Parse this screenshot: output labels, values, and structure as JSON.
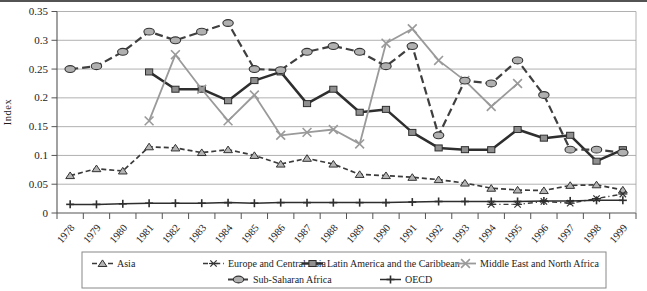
{
  "chart_data": {
    "type": "line",
    "title": "",
    "xlabel": "",
    "ylabel": "Index",
    "x": [
      1978,
      1979,
      1980,
      1981,
      1982,
      1983,
      1984,
      1985,
      1986,
      1987,
      1988,
      1989,
      1990,
      1991,
      1992,
      1993,
      1994,
      1995,
      1996,
      1997,
      1998,
      1999
    ],
    "ylim": [
      0,
      0.35
    ],
    "ytick_step": 0.05,
    "ytick_labels": [
      "0",
      "0.05",
      "0.1",
      "0.15",
      "0.2",
      "0.25",
      "0.3",
      "0.35"
    ],
    "grid": "horizontal",
    "legend_position": "bottom-box",
    "series": [
      {
        "name": "Asia",
        "marker": "triangle",
        "line": "dashed",
        "color": "#3a3a3a",
        "marker_fill": "#b4b4b4",
        "values": [
          0.065,
          0.077,
          0.073,
          0.115,
          0.113,
          0.105,
          0.11,
          0.1,
          0.085,
          0.095,
          0.085,
          0.067,
          0.065,
          0.062,
          0.058,
          0.052,
          0.043,
          0.04,
          0.039,
          0.048,
          0.049,
          0.04
        ]
      },
      {
        "name": "Europe and Central Asia",
        "marker": "asterisk",
        "line": "dash-dot",
        "color": "#3a3a3a",
        "marker_fill": "#3a3a3a",
        "values": [
          null,
          null,
          null,
          null,
          null,
          null,
          null,
          null,
          null,
          null,
          null,
          null,
          null,
          null,
          null,
          null,
          0.015,
          0.015,
          0.02,
          0.017,
          0.025,
          0.033
        ]
      },
      {
        "name": "Latin America and the Caribbean",
        "marker": "square",
        "line": "solid-thick",
        "color": "#2e2e2e",
        "marker_fill": "#8f8f8f",
        "values": [
          null,
          null,
          null,
          0.245,
          0.215,
          0.215,
          0.195,
          0.23,
          0.245,
          0.19,
          0.215,
          0.175,
          0.18,
          0.14,
          0.113,
          0.11,
          0.11,
          0.145,
          0.13,
          0.135,
          0.09,
          0.11
        ]
      },
      {
        "name": "Middle East and North Africa",
        "marker": "x",
        "line": "solid",
        "color": "#9a9a9a",
        "marker_fill": "#9a9a9a",
        "values": [
          null,
          null,
          null,
          0.16,
          0.275,
          0.215,
          0.16,
          0.205,
          0.135,
          0.14,
          0.145,
          0.12,
          0.295,
          0.32,
          0.265,
          0.23,
          0.185,
          0.225,
          null,
          null,
          null,
          null
        ]
      },
      {
        "name": "Sub-Saharan Africa",
        "marker": "oval",
        "line": "dashed-long",
        "color": "#3f3f3f",
        "marker_fill": "#b0b0b0",
        "values": [
          0.25,
          0.255,
          0.28,
          0.315,
          0.3,
          0.315,
          0.33,
          0.25,
          0.248,
          0.28,
          0.29,
          0.28,
          0.255,
          0.29,
          0.135,
          0.23,
          0.225,
          0.265,
          0.205,
          0.11,
          0.11,
          0.105
        ]
      },
      {
        "name": "OECD",
        "marker": "plus",
        "line": "solid-thin",
        "color": "#2e2e2e",
        "marker_fill": "#2e2e2e",
        "values": [
          0.015,
          0.015,
          0.016,
          0.017,
          0.017,
          0.017,
          0.018,
          0.017,
          0.018,
          0.018,
          0.018,
          0.018,
          0.018,
          0.019,
          0.02,
          0.02,
          0.02,
          0.02,
          0.021,
          0.021,
          0.022,
          0.022
        ]
      }
    ],
    "legend_rows": [
      [
        0,
        1,
        2,
        3
      ],
      [
        4,
        5
      ]
    ]
  }
}
